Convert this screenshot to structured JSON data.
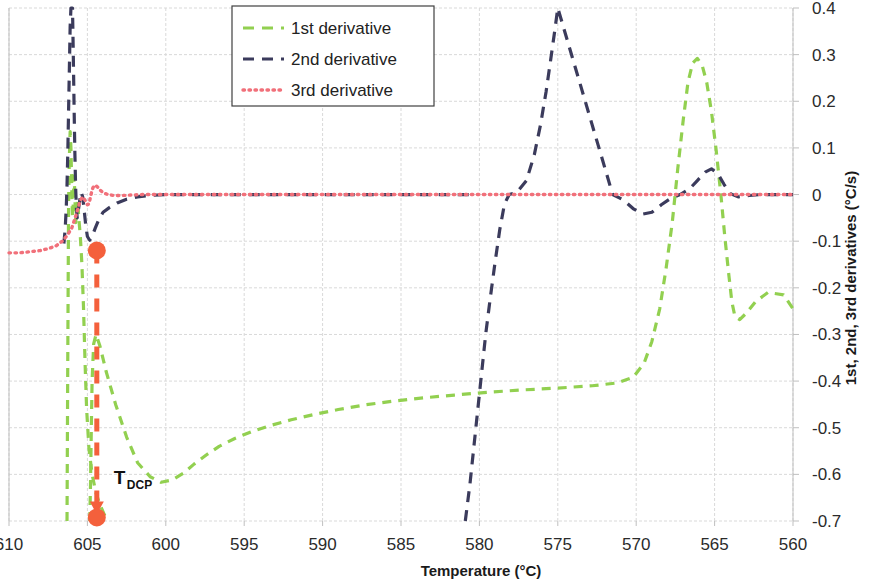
{
  "chart_data": {
    "type": "line",
    "title": "",
    "xlabel": "Temperature (°C)",
    "ylabel": "1st, 2nd, 3rd derivatives (°C/s)",
    "xlim": [
      610,
      560
    ],
    "ylim": [
      -0.7,
      0.4
    ],
    "x_reversed": true,
    "grid": true,
    "legend_position": "top-center",
    "x_ticks": [
      610,
      605,
      600,
      595,
      590,
      585,
      580,
      575,
      570,
      565,
      560
    ],
    "x_tick_labels": [
      "610",
      "605",
      "600",
      "595",
      "590",
      "585",
      "580",
      "575",
      "570",
      "565",
      "560"
    ],
    "y_ticks": [
      0.4,
      0.3,
      0.2,
      0.1,
      0,
      -0.1,
      -0.2,
      -0.3,
      -0.4,
      -0.5,
      -0.6,
      -0.7
    ],
    "y_tick_labels": [
      "0.4",
      "0.3",
      "0.2",
      "0.1",
      "0",
      "-0.1",
      "-0.2",
      "-0.3",
      "-0.4",
      "-0.5",
      "-0.6",
      "-0.7"
    ],
    "series": [
      {
        "name": "1st derivative",
        "color": "#92D050",
        "dash": "9,7",
        "width": 3.2,
        "linestyle": "dashed",
        "points": [
          [
            606.3,
            -0.7
          ],
          [
            606.25,
            -0.34
          ],
          [
            606.2,
            -0.02
          ],
          [
            606.15,
            0.08
          ],
          [
            606.1,
            0.135
          ],
          [
            606.05,
            0.1
          ],
          [
            606.0,
            0.02
          ],
          [
            605.95,
            -0.05
          ],
          [
            605.9,
            -0.02
          ],
          [
            605.85,
            0.04
          ],
          [
            605.8,
            0.0
          ],
          [
            605.75,
            -0.06
          ],
          [
            605.7,
            -0.035
          ],
          [
            605.62,
            -0.012
          ],
          [
            605.55,
            -0.05
          ],
          [
            605.45,
            -0.09
          ],
          [
            605.35,
            -0.15
          ],
          [
            605.25,
            -0.24
          ],
          [
            605.15,
            -0.36
          ],
          [
            605.05,
            -0.46
          ],
          [
            604.9,
            -0.545
          ],
          [
            604.7,
            -0.6
          ],
          [
            604.45,
            -0.64
          ],
          [
            604.2,
            -0.665
          ],
          [
            603.9,
            -0.688
          ],
          [
            603.7,
            -0.7
          ],
          [
            604.85,
            -0.7
          ],
          [
            604.8,
            -0.62
          ],
          [
            604.75,
            -0.5
          ],
          [
            604.7,
            -0.4
          ],
          [
            604.6,
            -0.32
          ],
          [
            604.45,
            -0.3
          ],
          [
            604.2,
            -0.325
          ],
          [
            603.8,
            -0.38
          ],
          [
            603.2,
            -0.45
          ],
          [
            602.5,
            -0.52
          ],
          [
            601.8,
            -0.575
          ],
          [
            601.0,
            -0.605
          ],
          [
            600.3,
            -0.617
          ],
          [
            599.6,
            -0.612
          ],
          [
            598.9,
            -0.598
          ],
          [
            598.2,
            -0.578
          ],
          [
            597.4,
            -0.558
          ],
          [
            596.6,
            -0.54
          ],
          [
            595.6,
            -0.523
          ],
          [
            594.5,
            -0.508
          ],
          [
            593.3,
            -0.495
          ],
          [
            592.0,
            -0.483
          ],
          [
            590.6,
            -0.472
          ],
          [
            589.0,
            -0.461
          ],
          [
            587.3,
            -0.451
          ],
          [
            585.5,
            -0.443
          ],
          [
            583.6,
            -0.436
          ],
          [
            581.6,
            -0.43
          ],
          [
            579.5,
            -0.424
          ],
          [
            577.3,
            -0.419
          ],
          [
            575.0,
            -0.415
          ],
          [
            572.8,
            -0.41
          ],
          [
            571.2,
            -0.404
          ],
          [
            570.2,
            -0.392
          ],
          [
            569.5,
            -0.362
          ],
          [
            569.0,
            -0.315
          ],
          [
            568.5,
            -0.245
          ],
          [
            568.1,
            -0.16
          ],
          [
            567.7,
            -0.06
          ],
          [
            567.35,
            0.055
          ],
          [
            567.0,
            0.16
          ],
          [
            566.7,
            0.24
          ],
          [
            566.4,
            0.282
          ],
          [
            566.1,
            0.292
          ],
          [
            565.8,
            0.278
          ],
          [
            565.5,
            0.24
          ],
          [
            565.2,
            0.178
          ],
          [
            564.9,
            0.095
          ],
          [
            564.6,
            0.0
          ],
          [
            564.35,
            -0.09
          ],
          [
            564.1,
            -0.17
          ],
          [
            563.9,
            -0.23
          ],
          [
            563.7,
            -0.262
          ],
          [
            563.4,
            -0.268
          ],
          [
            563.0,
            -0.255
          ],
          [
            562.4,
            -0.23
          ],
          [
            561.6,
            -0.21
          ],
          [
            560.6,
            -0.215
          ],
          [
            560.0,
            -0.245
          ]
        ]
      },
      {
        "name": "2nd derivative",
        "color": "#3B3B5C",
        "dash": "11,8",
        "width": 3.2,
        "linestyle": "dashed",
        "points": [
          [
            606.5,
            -0.105
          ],
          [
            606.42,
            -0.075
          ],
          [
            606.35,
            -0.03
          ],
          [
            606.3,
            0.02
          ],
          [
            606.25,
            0.09
          ],
          [
            606.2,
            0.18
          ],
          [
            606.15,
            0.27
          ],
          [
            606.1,
            0.36
          ],
          [
            606.05,
            0.4
          ],
          [
            605.95,
            0.4
          ],
          [
            605.9,
            0.3
          ],
          [
            605.85,
            0.19
          ],
          [
            605.8,
            0.09
          ],
          [
            605.75,
            0.015
          ],
          [
            605.7,
            -0.03
          ],
          [
            605.65,
            -0.05
          ],
          [
            605.6,
            -0.04
          ],
          [
            605.5,
            -0.015
          ],
          [
            605.4,
            0.005
          ],
          [
            605.3,
            -0.005
          ],
          [
            605.2,
            -0.035
          ],
          [
            605.1,
            -0.068
          ],
          [
            605.0,
            -0.09
          ],
          [
            604.85,
            -0.098
          ],
          [
            604.7,
            -0.09
          ],
          [
            604.5,
            -0.072
          ],
          [
            604.25,
            -0.052
          ],
          [
            604.0,
            -0.038
          ],
          [
            603.6,
            -0.028
          ],
          [
            603.1,
            -0.018
          ],
          [
            602.5,
            -0.01
          ],
          [
            601.8,
            -0.005
          ],
          [
            601.0,
            -0.002
          ],
          [
            600.0,
            0.0
          ],
          [
            598.5,
            0.0
          ],
          [
            596.5,
            0.0
          ],
          [
            594.0,
            0.0
          ],
          [
            591.0,
            0.0
          ],
          [
            588.0,
            0.0
          ],
          [
            585.0,
            0.0
          ],
          [
            582.5,
            0.0
          ],
          [
            580.5,
            0.0
          ],
          [
            580.9,
            -0.7
          ],
          [
            580.6,
            -0.62
          ],
          [
            580.35,
            -0.54
          ],
          [
            580.1,
            -0.46
          ],
          [
            579.85,
            -0.38
          ],
          [
            579.6,
            -0.3
          ],
          [
            579.3,
            -0.22
          ],
          [
            579.0,
            -0.145
          ],
          [
            578.7,
            -0.075
          ],
          [
            578.4,
            -0.02
          ],
          [
            578.1,
            0.0
          ],
          [
            577.6,
            0.005
          ],
          [
            577.0,
            0.03
          ],
          [
            576.5,
            0.085
          ],
          [
            576.1,
            0.15
          ],
          [
            575.75,
            0.22
          ],
          [
            575.45,
            0.29
          ],
          [
            575.2,
            0.35
          ],
          [
            575.0,
            0.4
          ],
          [
            571.5,
            0.0
          ],
          [
            570.8,
            -0.012
          ],
          [
            570.2,
            -0.03
          ],
          [
            569.6,
            -0.042
          ],
          [
            569.0,
            -0.038
          ],
          [
            568.4,
            -0.022
          ],
          [
            567.8,
            -0.008
          ],
          [
            567.2,
            0.0
          ],
          [
            566.6,
            0.012
          ],
          [
            566.1,
            0.03
          ],
          [
            565.6,
            0.048
          ],
          [
            565.2,
            0.055
          ],
          [
            564.8,
            0.045
          ],
          [
            564.4,
            0.022
          ],
          [
            564.0,
            0.002
          ],
          [
            563.5,
            -0.005
          ],
          [
            562.8,
            -0.002
          ],
          [
            562.0,
            0.0
          ],
          [
            561.0,
            0.0
          ],
          [
            560.0,
            0.0
          ]
        ]
      },
      {
        "name": "3rd derivative",
        "color": "#F1707A",
        "dash": "1.5,4.5",
        "width": 3.4,
        "linestyle": "dotted",
        "points": [
          [
            610.0,
            -0.125
          ],
          [
            609.5,
            -0.125
          ],
          [
            609.0,
            -0.124
          ],
          [
            608.5,
            -0.122
          ],
          [
            608.0,
            -0.12
          ],
          [
            607.5,
            -0.116
          ],
          [
            607.0,
            -0.11
          ],
          [
            606.6,
            -0.1
          ],
          [
            606.3,
            -0.088
          ],
          [
            606.0,
            -0.072
          ],
          [
            605.8,
            -0.052
          ],
          [
            605.6,
            -0.03
          ],
          [
            605.45,
            -0.012
          ],
          [
            605.3,
            -0.005
          ],
          [
            605.15,
            -0.012
          ],
          [
            605.0,
            -0.022
          ],
          [
            604.9,
            -0.02
          ],
          [
            604.8,
            -0.005
          ],
          [
            604.7,
            0.01
          ],
          [
            604.6,
            0.018
          ],
          [
            604.5,
            0.02
          ],
          [
            604.35,
            0.016
          ],
          [
            604.2,
            0.01
          ],
          [
            604.0,
            0.004
          ],
          [
            603.7,
            0.0
          ],
          [
            603.3,
            -0.002
          ],
          [
            602.8,
            -0.002
          ],
          [
            602.2,
            -0.001
          ],
          [
            601.5,
            0.0
          ],
          [
            600.5,
            0.0
          ],
          [
            599.0,
            0.0
          ],
          [
            597.0,
            0.0
          ],
          [
            594.0,
            0.0
          ],
          [
            590.0,
            0.0
          ],
          [
            586.0,
            0.0
          ],
          [
            582.0,
            0.0
          ],
          [
            578.0,
            0.0
          ],
          [
            574.0,
            0.0
          ],
          [
            570.0,
            0.0
          ],
          [
            567.0,
            0.0
          ],
          [
            564.0,
            0.0
          ],
          [
            562.0,
            0.0
          ],
          [
            560.0,
            0.0
          ]
        ]
      }
    ],
    "annotations": [
      {
        "name": "tdcp-marker",
        "label_main": "T",
        "label_sub": "DCP",
        "color": "#F4603C",
        "x": 604.4,
        "y_top": -0.12,
        "y_bottom": -0.688,
        "marker_style": "dashed-arrow-with-endpoints"
      }
    ]
  },
  "legend": {
    "entries": [
      {
        "label": "1st derivative",
        "color": "#92D050",
        "style": "dashed"
      },
      {
        "label": "2nd derivative",
        "color": "#3B3B5C",
        "style": "dashed"
      },
      {
        "label": "3rd derivative",
        "color": "#F1707A",
        "style": "dotted"
      }
    ]
  },
  "colors": {
    "grid": "#D9D9D9",
    "axis": "#BFBFBF",
    "background": "#FFFFFF",
    "text": "#1a1a1a",
    "annotation": "#F4603C"
  }
}
